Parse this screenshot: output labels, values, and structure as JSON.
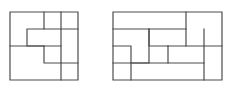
{
  "figure": {
    "background_color": "#ffffff",
    "line_color": "#4d4d4d",
    "line_width": 1.2,
    "panels": [
      {
        "name": "left-square-dissection",
        "shape": "square",
        "grid_columns": 4,
        "grid_rows": 4,
        "cell_size": 17,
        "origin_x": 10,
        "origin_y": 12,
        "width": 68,
        "height": 68,
        "piece_count": 4,
        "outline": "M 10 12 L 78 12 L 78 80 L 10 80 Z",
        "cuts": [
          "M 44 12 L 44 29 L 27 29 L 27 46 L 44 46 L 44 63 L 61 63 L 61 80",
          "M 61 12 L 61 29 L 78 29",
          "M 10 46 L 44 46",
          "M 61 46 L 61 63 L 78 63",
          "M 44 29 L 61 29 L 61 46 L 44 46"
        ]
      },
      {
        "name": "right-rectangle-dissection",
        "shape": "rectangle",
        "grid_columns": 6,
        "grid_rows": 4,
        "cell_size": 18,
        "origin_x": 113,
        "origin_y": 12,
        "width": 109,
        "height": 68,
        "piece_count": 6,
        "outline": "M 113 12 L 222 12 L 222 80 L 113 80 Z",
        "cuts": [
          "M 186 12 L 186 29 L 113 29",
          "M 204 29 L 204 46 L 222 46",
          "M 149 29 L 149 63 L 113 63",
          "M 149 29 L 149 46 L 168 46",
          "M 113 46 L 131 46 L 131 80",
          "M 168 46 L 168 63 L 204 63 L 204 80",
          "M 168 46 L 186 46 L 186 29",
          "M 204 63 L 204 46 L 186 46",
          "M 131 63 L 168 63"
        ]
      }
    ]
  }
}
